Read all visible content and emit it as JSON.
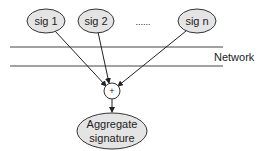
{
  "diagram": {
    "signatures": [
      {
        "label": "sig 1",
        "cx": 46,
        "cy": 21
      },
      {
        "label": "sig 2",
        "cx": 96,
        "cy": 21
      },
      {
        "label": "sig n",
        "cx": 197,
        "cy": 21
      }
    ],
    "ellipsis": "......",
    "network_label": "Network",
    "combiner_symbol": "+",
    "aggregate": {
      "line1": "Aggregate",
      "line2": "signature"
    },
    "colors": {
      "node_fill": "#e4e4e4",
      "stroke": "#333333",
      "line": "#444444"
    }
  }
}
